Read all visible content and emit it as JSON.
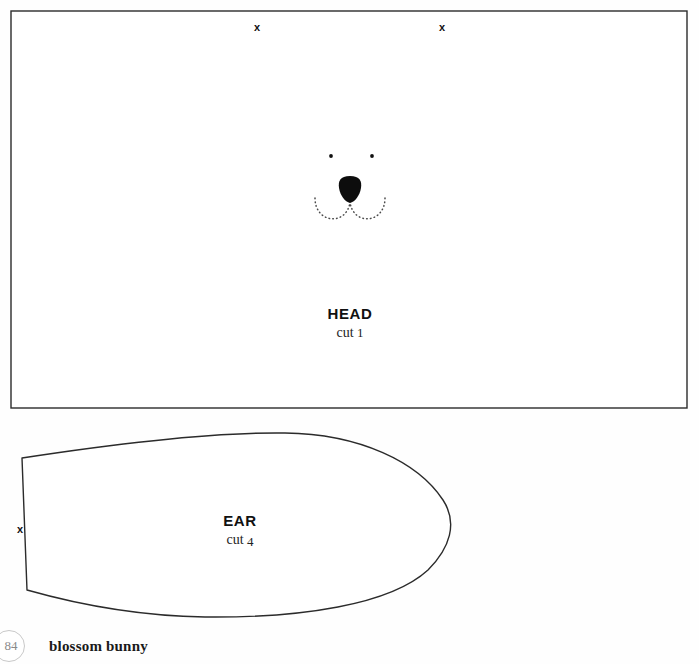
{
  "page": {
    "width": 699,
    "height": 664,
    "background_color": "#fefefe",
    "ink_color": "#222222"
  },
  "footer": {
    "page_number": "84",
    "title": "blossom bunny",
    "badge_border_color": "#c9c9c9",
    "badge_text_color": "#8a8a8a"
  },
  "pieces": [
    {
      "id": "head",
      "name": "HEAD",
      "cut_prefix": "cut",
      "cut_count": "1",
      "cut_text": "cut 1",
      "shape": "rectangle",
      "label_x": 350,
      "label_y": 308,
      "outline": {
        "x": 11,
        "y": 11,
        "width": 676,
        "height": 397,
        "stroke": "#2b2b2b",
        "stroke_width": 1.4,
        "fill": "#ffffff"
      },
      "notches": [
        {
          "id": "head-notch-left",
          "symbol": "x",
          "x": 258,
          "y": 28
        },
        {
          "id": "head-notch-right",
          "symbol": "x",
          "x": 443,
          "y": 28
        }
      ],
      "face": {
        "eyes": [
          {
            "id": "eye-left",
            "cx": 331,
            "cy": 156,
            "r": 1.9
          },
          {
            "id": "eye-right",
            "cx": 372,
            "cy": 156,
            "r": 1.9
          }
        ],
        "nose": {
          "id": "nose",
          "fill": "#0d0d0d",
          "cx": 350,
          "cy": 189,
          "width": 23,
          "height": 26
        },
        "mouth": {
          "id": "mouth",
          "style": "dotted",
          "dot_color": "#4a4a4a",
          "left_curve": "M 315 198 C 315 224, 347 226, 350 202",
          "right_curve": "M 385 198 C 385 224, 353 226, 350 202"
        }
      }
    },
    {
      "id": "ear",
      "name": "EAR",
      "cut_prefix": "cut",
      "cut_count": "4",
      "cut_text": "cut 4",
      "shape": "leaf",
      "label_x": 240,
      "label_y": 515,
      "outline": {
        "path": "M 22 458 C 120 443, 215 432, 285 433 C 360 434, 418 462, 443 500 C 458 523, 450 548, 428 570 C 390 605, 300 618, 205 617 C 140 616, 80 605, 27 590 Z",
        "stroke": "#2b2b2b",
        "stroke_width": 1.4,
        "fill": "#ffffff"
      },
      "notches": [
        {
          "id": "ear-notch-left",
          "symbol": "x",
          "x": 21,
          "y": 530
        }
      ]
    }
  ]
}
